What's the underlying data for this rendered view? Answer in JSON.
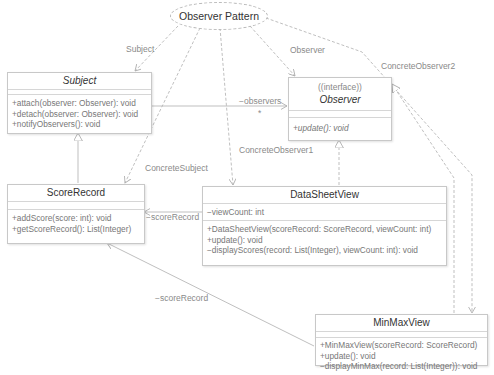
{
  "diagram": {
    "title": "Observer Pattern",
    "classes": {
      "subject": {
        "name": "Subject",
        "attributes": [],
        "operations": [
          "+attach(observer: Observer): void",
          "+detach(observer: Observer): void",
          "+notifyObservers(): void"
        ]
      },
      "observer": {
        "stereotype": "((interface))",
        "name": "Observer",
        "attributes": [],
        "operations": [
          "+update(): void"
        ]
      },
      "score_record": {
        "name": "ScoreRecord",
        "attributes": [],
        "operations": [
          "+addScore(score: int): void",
          "+getScoreRecord(): List(Integer)"
        ]
      },
      "data_sheet_view": {
        "name": "DataSheetView",
        "attributes": [
          "−viewCount: int"
        ],
        "operations": [
          "+DataSheetView(scoreRecord: ScoreRecord, viewCount: int)",
          "+update(): void",
          "−displayScores(record: List(Integer), viewCount: int): void"
        ]
      },
      "min_max_view": {
        "name": "MinMaxView",
        "attributes": [],
        "operations": [
          "+MinMaxView(scoreRecord: ScoreRecord)",
          "+update(): void",
          "−displayMinMax(record: List(Integer)): void"
        ]
      }
    },
    "labels": {
      "subject_role": "Subject",
      "observer_role": "Observer",
      "concrete_observer2": "ConcreteObserver2",
      "observers_assoc": "−observers",
      "multiplicity": "*",
      "concrete_subject": "ConcreteSubject",
      "concrete_observer1": "ConcreteObserver1",
      "score_record_assoc1": "−scoreRecord",
      "score_record_assoc2": "−scoreRecord"
    },
    "colors": {
      "line": "#b0b0b0",
      "border": "#c8c8c8",
      "text": "#333333",
      "muted_text": "#8a8a8a"
    }
  }
}
